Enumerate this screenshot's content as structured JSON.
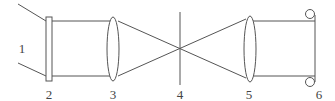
{
  "diagram": {
    "title": "",
    "colors": {
      "stroke": "#555555",
      "label": "#444444",
      "background": "#ffffff"
    },
    "components": [
      {
        "id": "1",
        "label": "1",
        "description": "incoming light beam"
      },
      {
        "id": "2",
        "label": "2",
        "description": "filter / plate"
      },
      {
        "id": "3",
        "label": "3",
        "description": "focusing lens"
      },
      {
        "id": "4",
        "label": "4",
        "description": "focal plane / aperture"
      },
      {
        "id": "5",
        "label": "5",
        "description": "collimating lens"
      },
      {
        "id": "6",
        "label": "6",
        "description": "output element with circular ends"
      }
    ],
    "labels": {
      "l1": "1",
      "l2": "2",
      "l3": "3",
      "l4": "4",
      "l5": "5",
      "l6": "6"
    }
  }
}
